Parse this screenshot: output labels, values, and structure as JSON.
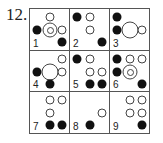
{
  "question_number": "12.",
  "positions": {
    "col_x": {
      "left": 7,
      "center": 20,
      "right": 32
    },
    "row_y": {
      "top": 8,
      "mid": 21,
      "bottom": 33
    }
  },
  "cells": [
    {
      "label": "1",
      "items": [
        {
          "type": "open",
          "col": "center",
          "row": "top"
        },
        {
          "type": "filled",
          "col": "left",
          "row": "mid"
        },
        {
          "type": "ring",
          "col": "center",
          "row": "mid"
        },
        {
          "type": "open",
          "col": "right",
          "row": "mid"
        },
        {
          "type": "filled",
          "col": "right",
          "row": "bottom"
        }
      ]
    },
    {
      "label": "2",
      "items": [
        {
          "type": "filled",
          "col": "left",
          "row": "top"
        },
        {
          "type": "open",
          "col": "center",
          "row": "top"
        },
        {
          "type": "open",
          "col": "center",
          "row": "mid"
        },
        {
          "type": "filled",
          "col": "right",
          "row": "bottom"
        }
      ]
    },
    {
      "label": "3",
      "items": [
        {
          "type": "filled",
          "col": "left",
          "row": "top"
        },
        {
          "type": "filled",
          "col": "left",
          "row": "mid"
        },
        {
          "type": "big",
          "col": "center",
          "row": "mid"
        },
        {
          "type": "open",
          "col": "right",
          "row": "mid"
        }
      ]
    },
    {
      "label": "4",
      "items": [
        {
          "type": "open",
          "col": "right",
          "row": "top"
        },
        {
          "type": "filled",
          "col": "left",
          "row": "mid"
        },
        {
          "type": "big",
          "col": "center",
          "row": "mid"
        },
        {
          "type": "open",
          "col": "right",
          "row": "mid"
        },
        {
          "type": "filled",
          "col": "center",
          "row": "bottom"
        }
      ]
    },
    {
      "label": "5",
      "items": [
        {
          "type": "filled",
          "col": "left",
          "row": "top"
        },
        {
          "type": "open",
          "col": "center",
          "row": "top"
        },
        {
          "type": "open",
          "col": "center",
          "row": "mid"
        },
        {
          "type": "open",
          "col": "right",
          "row": "mid"
        },
        {
          "type": "filled",
          "col": "center",
          "row": "bottom"
        },
        {
          "type": "filled",
          "col": "right",
          "row": "bottom"
        }
      ]
    },
    {
      "label": "6",
      "items": [
        {
          "type": "filled",
          "col": "left",
          "row": "top"
        },
        {
          "type": "open",
          "col": "center",
          "row": "top"
        },
        {
          "type": "open",
          "col": "right",
          "row": "top"
        },
        {
          "type": "filled",
          "col": "left",
          "row": "mid"
        },
        {
          "type": "ring",
          "col": "center",
          "row": "mid"
        },
        {
          "type": "filled",
          "col": "right",
          "row": "bottom"
        }
      ]
    },
    {
      "label": "7",
      "items": [
        {
          "type": "open",
          "col": "center",
          "row": "top"
        },
        {
          "type": "open",
          "col": "right",
          "row": "top"
        },
        {
          "type": "open",
          "col": "center",
          "row": "mid"
        },
        {
          "type": "filled",
          "col": "center",
          "row": "bottom"
        },
        {
          "type": "filled",
          "col": "right",
          "row": "bottom"
        }
      ]
    },
    {
      "label": "8",
      "items": [
        {
          "type": "open",
          "col": "right",
          "row": "mid"
        },
        {
          "type": "filled",
          "col": "center",
          "row": "bottom"
        }
      ]
    },
    {
      "label": "9",
      "items": [
        {
          "type": "open",
          "col": "center",
          "row": "top"
        },
        {
          "type": "open",
          "col": "right",
          "row": "top"
        },
        {
          "type": "open",
          "col": "center",
          "row": "mid"
        },
        {
          "type": "open",
          "col": "right",
          "row": "mid"
        },
        {
          "type": "filled",
          "col": "right",
          "row": "bottom"
        }
      ]
    }
  ]
}
